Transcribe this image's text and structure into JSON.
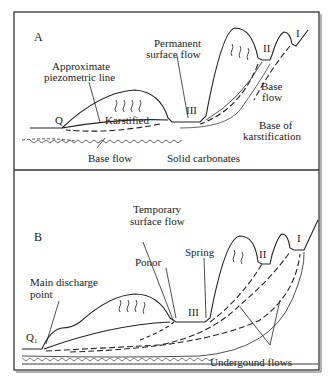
{
  "panel_a": {
    "letter": "A",
    "labels": {
      "piezometric_1": "Approximate",
      "piezometric_2": "piezometric line",
      "permanent_1": "Permanent",
      "permanent_2": "surface flow",
      "karstified": "Karstified",
      "q": "Q",
      "base_flow_bottom": "Base flow",
      "base_flow_right_1": "Base",
      "base_flow_right_2": "flow",
      "base_karst_1": "Base of",
      "base_karst_2": "karstification",
      "solid": "Solid carbonates",
      "level_iii": "III",
      "level_ii": "II",
      "level_i": "I"
    }
  },
  "panel_b": {
    "letter": "B",
    "labels": {
      "temporary_1": "Temporary",
      "temporary_2": "surface flow",
      "ponor": "Ponor",
      "spring": "Spring",
      "main_discharge_1": "Main discharge",
      "main_discharge_2": "point",
      "q1": "Q",
      "q1_sub": "1",
      "underground": "Undergound flows",
      "level_iii": "III",
      "level_ii": "II",
      "level_i": "I"
    }
  },
  "colors": {
    "line": "#222222",
    "frame": "#333333",
    "background": "#ffffff"
  }
}
